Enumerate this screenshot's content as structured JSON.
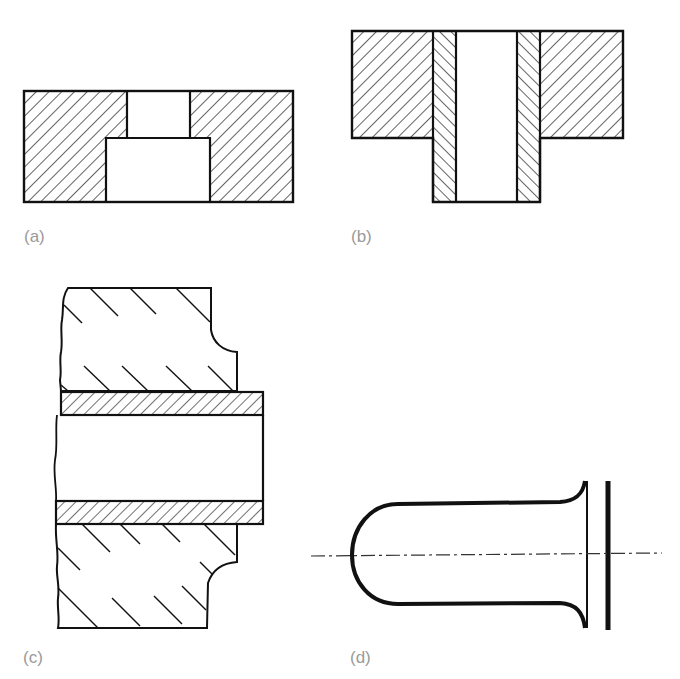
{
  "figure": {
    "panels": [
      {
        "id": "a",
        "label": "(a)",
        "description": "Stepped bore section through solid block"
      },
      {
        "id": "b",
        "label": "(b)",
        "description": "Flanged housing with pressed-in bush (sleeve)"
      },
      {
        "id": "c",
        "label": "(c)",
        "description": "Tube passing through broken-out wall section"
      },
      {
        "id": "d",
        "label": "(d)",
        "description": "Drawn cup with flared lip against plate, centre line"
      }
    ],
    "colors": {
      "line": "#111111",
      "label": "#9a9a9a",
      "background": "#ffffff"
    }
  }
}
